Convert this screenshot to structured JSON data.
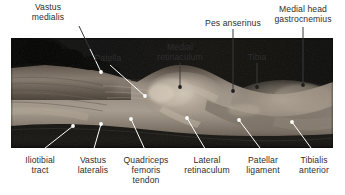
{
  "figure": {
    "kind": "anatomical-dissection-photograph",
    "photo": {
      "x": 11,
      "y": 38,
      "width": 322,
      "height": 110
    }
  },
  "labels": {
    "top": [
      {
        "id": "vastus-medialis",
        "text": "Vastus\nmedialis",
        "x": 20,
        "y": 2,
        "w": 56,
        "align": "center"
      },
      {
        "id": "patella",
        "text": "Patella",
        "x": 86,
        "y": 53,
        "w": 44,
        "align": "center"
      },
      {
        "id": "medial-retinaculum",
        "text": "Medial\nretinaculum",
        "x": 147,
        "y": 42,
        "w": 66,
        "align": "center"
      },
      {
        "id": "pes-anserinus",
        "text": "Pes anserinus",
        "x": 205,
        "y": 18,
        "w": 70,
        "align": "center"
      },
      {
        "id": "tibia",
        "text": "Tibia",
        "x": 240,
        "y": 52,
        "w": 34,
        "align": "center"
      },
      {
        "id": "medial-head-gastrocnemius",
        "text": "Medial head\ngastrocnemius",
        "x": 271,
        "y": 4,
        "w": 74,
        "align": "center"
      }
    ],
    "bottom": [
      {
        "id": "iliotibial-tract",
        "text": "Iliotibial\ntract",
        "x": 15,
        "y": 155,
        "w": 50,
        "align": "center"
      },
      {
        "id": "vastus-lateralis",
        "text": "Vastus\nlateralis",
        "x": 68,
        "y": 155,
        "w": 50,
        "align": "center"
      },
      {
        "id": "quadriceps-femoris-tendon",
        "text": "Quadriceps\nfemoris\ntendon",
        "x": 117,
        "y": 155,
        "w": 58,
        "align": "center"
      },
      {
        "id": "lateral-retinaculum",
        "text": "Lateral\nretinaculum",
        "x": 176,
        "y": 155,
        "w": 62,
        "align": "center"
      },
      {
        "id": "patellar-ligament",
        "text": "Patellar\nligament",
        "x": 237,
        "y": 155,
        "w": 52,
        "align": "center"
      },
      {
        "id": "tibialis-anterior",
        "text": "Tibialis\nanterior",
        "x": 289,
        "y": 155,
        "w": 50,
        "align": "center"
      }
    ]
  },
  "leaders": [
    {
      "id": "leader-vastus-medialis",
      "color": "#ffffff",
      "x1": 79,
      "y1": 26,
      "x2": 101,
      "y2": 72,
      "dot": true,
      "dot_color": "#ffffff",
      "outside_color": "#404040",
      "split_y": 38
    },
    {
      "id": "leader-patella",
      "color": "#ffffff",
      "x1": 110,
      "y1": 65,
      "x2": 145,
      "y2": 96,
      "dot": true,
      "dot_color": "#ffffff"
    },
    {
      "id": "leader-medial-retinaculum",
      "color": "#404040",
      "x1": 180,
      "y1": 63,
      "x2": 180,
      "y2": 85,
      "dot": true,
      "dot_color": "#2b2b2b"
    },
    {
      "id": "leader-pes-anserinus",
      "color": "#404040",
      "x1": 233,
      "y1": 28,
      "x2": 233,
      "y2": 90,
      "dot": true,
      "dot_color": "#2b2b2b"
    },
    {
      "id": "leader-tibia",
      "color": "#404040",
      "x1": 257,
      "y1": 62,
      "x2": 257,
      "y2": 86,
      "dot": true,
      "dot_color": "#2b2b2b"
    },
    {
      "id": "leader-medial-head-gastrocnemius",
      "color": "#404040",
      "x1": 303,
      "y1": 26,
      "x2": 303,
      "y2": 84,
      "dot": true,
      "dot_color": "#2b2b2b"
    },
    {
      "id": "leader-iliotibial-tract",
      "color": "#ffffff",
      "x1": 40,
      "y1": 153,
      "x2": 73,
      "y2": 126,
      "dot": true,
      "dot_color": "#ffffff"
    },
    {
      "id": "leader-vastus-lateralis",
      "color": "#ffffff",
      "x1": 93,
      "y1": 153,
      "x2": 101,
      "y2": 124,
      "dot": true,
      "dot_color": "#ffffff"
    },
    {
      "id": "leader-quadriceps-femoris-tendon",
      "color": "#ffffff",
      "x1": 146,
      "y1": 153,
      "x2": 131,
      "y2": 119,
      "dot": true,
      "dot_color": "#ffffff"
    },
    {
      "id": "leader-lateral-retinaculum",
      "color": "#ffffff",
      "x1": 207,
      "y1": 153,
      "x2": 187,
      "y2": 118,
      "dot": true,
      "dot_color": "#ffffff"
    },
    {
      "id": "leader-patellar-ligament",
      "color": "#ffffff",
      "x1": 263,
      "y1": 153,
      "x2": 239,
      "y2": 120,
      "dot": true,
      "dot_color": "#ffffff"
    },
    {
      "id": "leader-tibialis-anterior",
      "color": "#ffffff",
      "x1": 314,
      "y1": 153,
      "x2": 292,
      "y2": 122,
      "dot": true,
      "dot_color": "#ffffff"
    }
  ],
  "colors": {
    "background": "#ffffff",
    "text": "#2e2e2e",
    "leader_light": "#ffffff",
    "leader_dark": "#404040",
    "photo_dark": "#161614",
    "photo_mid": "#7d736a",
    "photo_light": "#c9bfb2"
  }
}
